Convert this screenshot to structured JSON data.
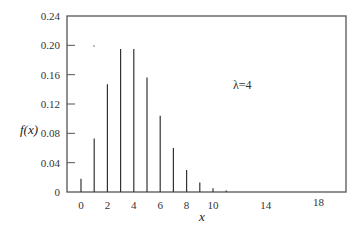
{
  "chart_data": {
    "type": "bar",
    "title": "",
    "xlabel": "x",
    "ylabel": "f(x)",
    "annotation": "λ=4",
    "x": [
      0,
      1,
      2,
      3,
      4,
      5,
      6,
      7,
      8,
      9,
      10,
      11
    ],
    "values": [
      0.018,
      0.073,
      0.147,
      0.195,
      0.195,
      0.156,
      0.104,
      0.06,
      0.03,
      0.013,
      0.005,
      0.002
    ],
    "xticks": [
      "0",
      "2",
      "4",
      "6",
      "8",
      "10",
      "14",
      "18"
    ],
    "yticks": [
      "0",
      "0.04",
      "0.08",
      "0.12",
      "0.16",
      "0.20",
      "0.24"
    ],
    "ylim": [
      0,
      0.24
    ],
    "xlim": [
      -1,
      20
    ],
    "grid": false,
    "legend": null
  }
}
